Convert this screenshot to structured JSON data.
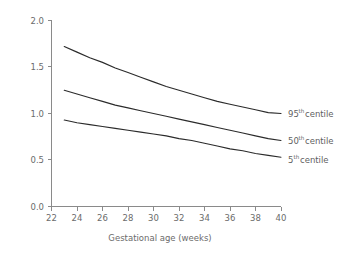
{
  "chart_data": {
    "type": "line",
    "title": "",
    "subtitle": "",
    "xlabel": "Gestational age (weeks)",
    "ylabel": "",
    "xlim": [
      22,
      40
    ],
    "ylim": [
      0.0,
      2.0
    ],
    "xticks": [
      22,
      24,
      26,
      28,
      30,
      32,
      34,
      36,
      38,
      40
    ],
    "yticks": [
      "0.0",
      "0.5",
      "1.0",
      "1.5",
      "2.0"
    ],
    "ytick_values": [
      0.0,
      0.5,
      1.0,
      1.5,
      2.0
    ],
    "grid": false,
    "legend_position": "right-inline-labels",
    "x": [
      23,
      24,
      25,
      26,
      27,
      28,
      29,
      30,
      31,
      32,
      33,
      34,
      35,
      36,
      37,
      38,
      39,
      40
    ],
    "series": [
      {
        "name": "95th centile",
        "label_text": "95",
        "label_sup": "th",
        "label_suffix": " centile",
        "color": "#2b2b2b",
        "values": [
          1.72,
          1.66,
          1.6,
          1.55,
          1.49,
          1.44,
          1.39,
          1.34,
          1.29,
          1.25,
          1.21,
          1.17,
          1.13,
          1.1,
          1.07,
          1.04,
          1.01,
          1.0
        ]
      },
      {
        "name": "50th centile",
        "label_text": "50",
        "label_sup": "th",
        "label_suffix": " centile",
        "color": "#2b2b2b",
        "values": [
          1.25,
          1.21,
          1.17,
          1.13,
          1.09,
          1.06,
          1.03,
          1.0,
          0.97,
          0.94,
          0.91,
          0.88,
          0.85,
          0.82,
          0.79,
          0.76,
          0.73,
          0.71
        ]
      },
      {
        "name": "5th centile",
        "label_text": "5",
        "label_sup": "th",
        "label_suffix": " centile",
        "color": "#2b2b2b",
        "values": [
          0.93,
          0.9,
          0.88,
          0.86,
          0.84,
          0.82,
          0.8,
          0.78,
          0.76,
          0.73,
          0.71,
          0.68,
          0.65,
          0.62,
          0.6,
          0.57,
          0.55,
          0.53
        ]
      }
    ]
  },
  "axes": {
    "x_title": "Gestational age (weeks)",
    "xticks": [
      "22",
      "24",
      "26",
      "28",
      "30",
      "32",
      "34",
      "36",
      "38",
      "40"
    ],
    "yticks": [
      "0.0",
      "0.5",
      "1.0",
      "1.5",
      "2.0"
    ]
  },
  "labels": {
    "s95_num": "95",
    "s95_sup": "th",
    "s95_suffix": " centile",
    "s50_num": "50",
    "s50_sup": "th",
    "s50_suffix": " centile",
    "s5_num": "5",
    "s5_sup": "th",
    "s5_suffix": " centile"
  },
  "colors": {
    "line": "#2b2b2b",
    "axis": "#8a8a8a",
    "tick_text": "#6b6b6b",
    "background": "#ffffff"
  }
}
